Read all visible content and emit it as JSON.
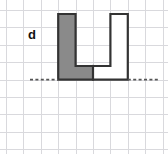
{
  "figure": {
    "label": "d",
    "label_x": 28,
    "label_y": 28,
    "type": "grid-polygon-shape",
    "colors": {
      "background": "#ffffff",
      "grid_line": "#d9d9dd",
      "outline": "#333333",
      "shaded_fill": "#8a8a8a",
      "unshaded_fill": "#ffffff",
      "dashed_line": "#555555",
      "label_color": "#111111"
    },
    "grid": {
      "cell_size": 17.4,
      "origin_x": 6,
      "origin_y": 10,
      "columns": 9,
      "rows": 8,
      "vertical_lines": [
        6,
        23.4,
        40.8,
        58.2,
        75.6,
        93,
        110.4,
        127.8,
        145.2,
        162.6
      ],
      "horizontal_lines": [
        10,
        27.4,
        44.8,
        62.2,
        79.6,
        97,
        114.4,
        131.8,
        149.2
      ]
    },
    "shapes": [
      {
        "name": "shaded-l-piece",
        "fill": "shaded",
        "cells": [
          [
            3,
            0
          ],
          [
            3,
            1
          ],
          [
            3,
            2
          ],
          [
            4,
            2
          ]
        ],
        "points": "58.2,14 75.6,14 75.6,66 93,66 93,79.6 58.2,79.6"
      },
      {
        "name": "unshaded-j-piece",
        "fill": "unshaded",
        "cells": [
          [
            5,
            0
          ],
          [
            5,
            1
          ],
          [
            5,
            2
          ],
          [
            4,
            2
          ]
        ],
        "points": "110.4,14 127.8,14 127.8,79.6 93,79.6 93,66 110.4,66"
      }
    ],
    "outline_path": "58.2,14 75.6,14 75.6,66 110.4,66 110.4,14 127.8,14 127.8,79.6 58.2,79.6",
    "internal_edge": "93,66 93,79.6",
    "baseline": {
      "y": 79.6,
      "left_start": 30,
      "left_end": 58.2,
      "right_start": 127.8,
      "right_end": 158,
      "style": "dashed"
    }
  }
}
